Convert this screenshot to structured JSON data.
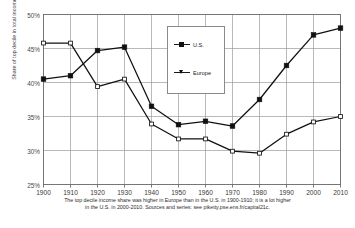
{
  "chart_data": {
    "type": "line",
    "title": "",
    "xlabel": "",
    "ylabel": "Share of top decile in total income",
    "x": [
      1900,
      1910,
      1920,
      1930,
      1940,
      1950,
      1960,
      1970,
      1980,
      1990,
      2000,
      2010
    ],
    "xtick_labels": [
      "1900",
      "1910",
      "1920",
      "1930",
      "1940",
      "1950",
      "1960",
      "1970",
      "1980",
      "1990",
      "2000",
      "2010"
    ],
    "ytick_labels": [
      "25%",
      "30%",
      "35%",
      "40%",
      "45%",
      "50%"
    ],
    "ytick_values": [
      25,
      30,
      35,
      40,
      45,
      50
    ],
    "ylim": [
      25,
      50
    ],
    "xlim": [
      1900,
      2010
    ],
    "grid": true,
    "legend_position": "upper-center",
    "series": [
      {
        "name": "U.S.",
        "marker": "filled-square",
        "color": "#111111",
        "values": [
          40.5,
          41.0,
          44.7,
          45.2,
          36.5,
          33.8,
          34.3,
          33.6,
          37.5,
          42.5,
          47.0,
          48.0
        ]
      },
      {
        "name": "Europe",
        "marker": "open-square",
        "color": "#111111",
        "values": [
          45.8,
          45.8,
          39.4,
          40.5,
          33.9,
          31.7,
          31.7,
          29.9,
          29.6,
          32.4,
          34.2,
          35.0
        ]
      }
    ],
    "legend_entries": [
      "U.S.",
      "Europe"
    ],
    "caption_lines": [
      "The top decile income share was higher in Europe than in the U.S. in 1900-1910; it is a lot higher",
      "in the U.S. in 2000-2010. Sources and series: see piketty.pse.ens.fr/capital21c."
    ]
  }
}
